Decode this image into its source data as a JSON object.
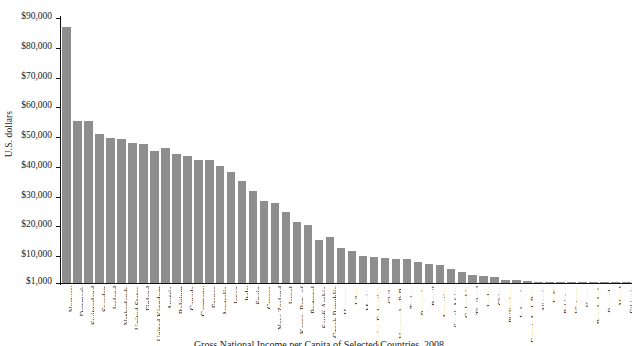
{
  "chart_data": {
    "type": "bar",
    "title": "Gross National Income per Capita of Selected Countries, 2008",
    "xlabel": "",
    "ylabel": "U.S. dollars",
    "ylim": [
      1000,
      90000
    ],
    "ytick_labels": [
      "$90,000",
      "$80,000",
      "$70,000",
      "$60,000",
      "$50,000",
      "$40,000",
      "$30,000",
      "$20,000",
      "$10,000",
      "$1,000"
    ],
    "ytick_values": [
      90000,
      80000,
      70000,
      60000,
      50000,
      40000,
      30000,
      20000,
      10000,
      1000
    ],
    "grid": false,
    "legend": null,
    "bar_color": "#8e8e8e",
    "categories": [
      "Norway",
      "Denmark",
      "Switzerland",
      "Sweden",
      "Ireland",
      "Netherlands",
      "United States",
      "Finland",
      "United Kingdom",
      "Austria",
      "Belgium",
      "Canada",
      "Germany",
      "France",
      "Australia",
      "Japan",
      "Italy",
      "Spain",
      "Greece",
      "New Zealand",
      "Israel",
      "Korea, Rep. of",
      "Portugal",
      "Saudi Arabia",
      "Czech Republic",
      "Hungary",
      "Libya",
      "Mexico",
      "Russian Federation",
      "Chile",
      "Venezuela, R.B.",
      "Turkey",
      "Romania",
      "Brazil",
      "Argentina",
      "South Africa",
      "Columbia",
      "Thailand",
      "Jordan",
      "China",
      "Philippines",
      "Indonesia",
      "Egypt, Arab Rep.",
      "Nigeria",
      "India",
      "Pakistan",
      "Vietnam",
      "Kenya",
      "Bangladesh",
      "Rwanda",
      "Nepal",
      "Ethiopia"
    ],
    "values": [
      87070,
      55440,
      55510,
      50940,
      49590,
      49350,
      47930,
      47600,
      45390,
      46260,
      44330,
      43640,
      42440,
      42250,
      40350,
      38210,
      35240,
      31960,
      28650,
      27940,
      24700,
      21530,
      20560,
      15500,
      16600,
      12810,
      11590,
      9980,
      9620,
      9400,
      9230,
      9020,
      7930,
      7350,
      7200,
      5820,
      4660,
      3670,
      3310,
      2940,
      1890,
      2010,
      1800,
      1160,
      1070,
      980,
      890,
      770,
      520,
      410,
      400,
      280
    ]
  },
  "caption": {
    "text": "Gross National Income per Capita of Selected Countries, 2008"
  }
}
